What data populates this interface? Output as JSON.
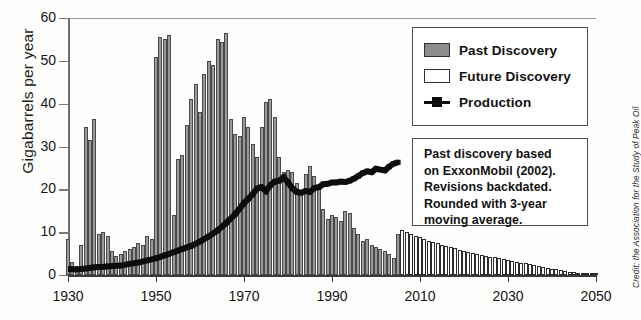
{
  "chart_data": {
    "type": "bar",
    "title": "",
    "xlabel": "",
    "ylabel": "Gigabarrels per year",
    "xlim": [
      1930,
      2050
    ],
    "ylim": [
      0,
      60
    ],
    "yticks": [
      0,
      10,
      20,
      30,
      40,
      50,
      60
    ],
    "xticks": [
      1930,
      1950,
      1970,
      1990,
      2010,
      2030,
      2050
    ],
    "grid": false,
    "legend_position": "top-right",
    "legend": [
      "Past Discovery",
      "Future Discovery",
      "Production"
    ],
    "colors": {
      "past_discovery": "#9a9a9a",
      "future_discovery": "#ffffff",
      "production": "#0d0d0d",
      "axis": "#3a3a3a"
    },
    "series": [
      {
        "name": "Past Discovery",
        "type": "bar",
        "x": [
          1930,
          1931,
          1932,
          1933,
          1934,
          1935,
          1936,
          1937,
          1938,
          1939,
          1940,
          1941,
          1942,
          1943,
          1944,
          1945,
          1946,
          1947,
          1948,
          1949,
          1950,
          1951,
          1952,
          1953,
          1954,
          1955,
          1956,
          1957,
          1958,
          1959,
          1960,
          1961,
          1962,
          1963,
          1964,
          1965,
          1966,
          1967,
          1968,
          1969,
          1970,
          1971,
          1972,
          1973,
          1974,
          1975,
          1976,
          1977,
          1978,
          1979,
          1980,
          1981,
          1982,
          1983,
          1984,
          1985,
          1986,
          1987,
          1988,
          1989,
          1990,
          1991,
          1992,
          1993,
          1994,
          1995,
          1996,
          1997,
          1998,
          1999,
          2000,
          2001,
          2002,
          2003,
          2004,
          2005
        ],
        "values": [
          8.5,
          3.0,
          2.0,
          7.0,
          34.5,
          31.5,
          36.5,
          9.5,
          10.0,
          9.0,
          5.5,
          4.5,
          5.0,
          5.5,
          6.0,
          6.5,
          7.5,
          7.0,
          9.0,
          8.5,
          51.0,
          55.5,
          55.0,
          56.0,
          14.0,
          27.0,
          28.0,
          35.0,
          41.0,
          44.5,
          38.0,
          47.0,
          50.0,
          49.0,
          55.0,
          54.5,
          56.5,
          36.5,
          33.0,
          32.5,
          37.0,
          34.5,
          30.5,
          27.5,
          34.5,
          40.5,
          41.0,
          37.0,
          27.5,
          24.0,
          24.5,
          24.0,
          21.5,
          19.5,
          23.5,
          25.5,
          23.0,
          20.0,
          15.5,
          13.0,
          14.0,
          13.5,
          12.5,
          15.0,
          14.5,
          11.0,
          9.5,
          8.0,
          8.5,
          7.0,
          6.5,
          6.0,
          5.5,
          5.0,
          4.0,
          9.5
        ]
      },
      {
        "name": "Future Discovery",
        "type": "bar",
        "x": [
          2006,
          2007,
          2008,
          2009,
          2010,
          2011,
          2012,
          2013,
          2014,
          2015,
          2016,
          2017,
          2018,
          2019,
          2020,
          2021,
          2022,
          2023,
          2024,
          2025,
          2026,
          2027,
          2028,
          2029,
          2030,
          2031,
          2032,
          2033,
          2034,
          2035,
          2036,
          2037,
          2038,
          2039,
          2040,
          2041,
          2042,
          2043,
          2044,
          2045,
          2046,
          2047,
          2048,
          2049,
          2050
        ],
        "values": [
          10.5,
          10.0,
          9.6,
          9.2,
          8.8,
          8.4,
          8.0,
          7.7,
          7.4,
          7.1,
          6.8,
          6.5,
          6.2,
          5.9,
          5.6,
          5.3,
          5.1,
          4.9,
          4.7,
          4.5,
          4.3,
          4.1,
          3.9,
          3.7,
          3.5,
          3.3,
          3.1,
          2.9,
          2.7,
          2.5,
          2.3,
          2.1,
          1.9,
          1.7,
          1.5,
          1.3,
          1.1,
          0.95,
          0.8,
          0.65,
          0.5,
          0.4,
          0.3,
          0.2,
          0.1
        ]
      },
      {
        "name": "Production",
        "type": "line",
        "x": [
          1930,
          1932,
          1934,
          1936,
          1938,
          1940,
          1942,
          1944,
          1946,
          1948,
          1950,
          1952,
          1954,
          1956,
          1958,
          1960,
          1962,
          1964,
          1966,
          1968,
          1970,
          1971,
          1972,
          1973,
          1974,
          1975,
          1976,
          1977,
          1978,
          1979,
          1980,
          1981,
          1982,
          1983,
          1984,
          1985,
          1986,
          1987,
          1988,
          1989,
          1990,
          1991,
          1992,
          1993,
          1994,
          1995,
          1996,
          1997,
          1998,
          1999,
          2000,
          2001,
          2002,
          2003,
          2004,
          2005
        ],
        "values": [
          1.4,
          1.3,
          1.5,
          1.8,
          1.9,
          2.1,
          2.2,
          2.6,
          2.9,
          3.4,
          3.9,
          4.6,
          5.3,
          6.1,
          6.8,
          7.8,
          9.0,
          10.4,
          12.2,
          14.2,
          16.8,
          17.8,
          18.9,
          20.2,
          20.5,
          19.6,
          21.0,
          21.8,
          22.0,
          22.8,
          21.6,
          20.2,
          19.4,
          19.2,
          19.6,
          19.4,
          20.3,
          20.5,
          21.2,
          21.3,
          21.6,
          21.6,
          21.8,
          21.7,
          22.0,
          22.5,
          23.1,
          23.8,
          24.2,
          24.0,
          24.8,
          24.6,
          24.4,
          25.3,
          26.0,
          26.3
        ]
      }
    ],
    "annotations": [
      "Past discovery based",
      "on ExxonMobil (2002).",
      "Revisions backdated.",
      "Rounded with 3-year",
      "moving average."
    ],
    "credit": "Credit: the Association for the Study of Peak Oil"
  },
  "legend": {
    "past_label": "Past Discovery",
    "future_label": "Future Discovery",
    "production_label": "Production"
  },
  "note": {
    "line1": "Past discovery based",
    "line2": "on ExxonMobil (2002).",
    "line3": "Revisions backdated.",
    "line4": "Rounded with 3-year",
    "line5": "moving average."
  },
  "axes": {
    "ylabel": "Gigabarrels per year",
    "credit": "Credit: the Association for the Study of Peak Oil"
  }
}
